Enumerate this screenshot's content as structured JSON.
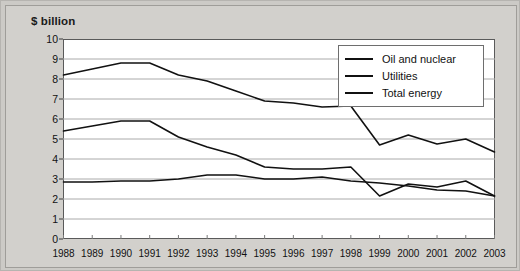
{
  "chart": {
    "title": "$ billion",
    "legend_position": "top-right"
  },
  "legend": {
    "items": [
      {
        "label": "Oil and nuclear",
        "color": "#111111"
      },
      {
        "label": "Utilities",
        "color": "#111111"
      },
      {
        "label": "Total energy",
        "color": "#111111"
      }
    ]
  },
  "chart_data": {
    "type": "line",
    "title": "$ billion",
    "xlabel": "",
    "ylabel": "$ billion",
    "ylim": [
      0,
      10
    ],
    "ytick_step": 1,
    "grid": true,
    "legend_position": "top-right",
    "categories": [
      "1988",
      "1989",
      "1990",
      "1991",
      "1992",
      "1993",
      "1994",
      "1995",
      "1996",
      "1997",
      "1998",
      "1999",
      "2000",
      "2001",
      "2002",
      "2003"
    ],
    "yticks": [
      "0",
      "1",
      "2",
      "3",
      "4",
      "5",
      "6",
      "7",
      "8",
      "9",
      "10"
    ],
    "series": [
      {
        "name": "Oil and nuclear",
        "color": "#111111",
        "values": [
          5.4,
          5.65,
          5.9,
          5.9,
          5.1,
          4.6,
          4.2,
          3.6,
          3.5,
          3.5,
          3.6,
          2.15,
          2.75,
          2.6,
          2.9,
          2.15
        ]
      },
      {
        "name": "Utilities",
        "color": "#111111",
        "values": [
          2.85,
          2.85,
          2.9,
          2.9,
          3.0,
          3.2,
          3.2,
          3.0,
          3.0,
          3.1,
          2.9,
          2.8,
          2.65,
          2.45,
          2.4,
          2.15
        ]
      },
      {
        "name": "Total energy",
        "color": "#111111",
        "values": [
          8.2,
          8.5,
          8.8,
          8.8,
          8.2,
          7.9,
          7.4,
          6.9,
          6.8,
          6.6,
          6.65,
          4.7,
          5.2,
          4.75,
          5.0,
          4.35
        ]
      }
    ]
  }
}
